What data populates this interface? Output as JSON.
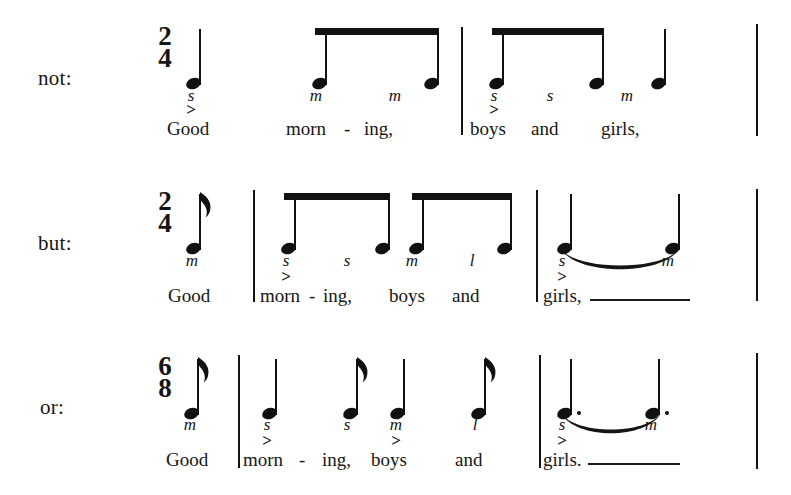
{
  "figure": {
    "background_color": "#ffffff",
    "ink_color": "#141414"
  },
  "systems": [
    {
      "id": "system-not",
      "label": "not:",
      "time_signature": {
        "numerator": "2",
        "denominator": "4"
      },
      "events": [
        {
          "type": "quarter",
          "solfa": "s",
          "accent": ">",
          "lyric": "Good"
        },
        {
          "type": "eighth-beamed",
          "solfa": "m",
          "accent": "",
          "lyric": "morn"
        },
        {
          "type": "hyphen",
          "solfa": "",
          "accent": "",
          "lyric": "-"
        },
        {
          "type": "eighth-beamed",
          "solfa": "m",
          "accent": "",
          "lyric": "ing,"
        },
        {
          "type": "eighth-beamed",
          "solfa": "s",
          "accent": ">",
          "lyric": "boys"
        },
        {
          "type": "eighth-beamed",
          "solfa": "s",
          "accent": "",
          "lyric": "and"
        },
        {
          "type": "quarter",
          "solfa": "m",
          "accent": "",
          "lyric": "girls,"
        }
      ]
    },
    {
      "id": "system-but",
      "label": "but:",
      "time_signature": {
        "numerator": "2",
        "denominator": "4"
      },
      "events": [
        {
          "type": "eighth",
          "solfa": "m",
          "accent": "",
          "lyric": "Good"
        },
        {
          "type": "eighth-beamed",
          "solfa": "s",
          "accent": ">",
          "lyric": "morn"
        },
        {
          "type": "hyphen",
          "solfa": "",
          "accent": "",
          "lyric": "-"
        },
        {
          "type": "eighth-beamed",
          "solfa": "s",
          "accent": "",
          "lyric": "ing,"
        },
        {
          "type": "eighth-beamed",
          "solfa": "m",
          "accent": "",
          "lyric": "boys"
        },
        {
          "type": "eighth-beamed",
          "solfa": "l",
          "accent": "",
          "lyric": "and"
        },
        {
          "type": "quarter-tied",
          "solfa": "s",
          "accent": ">",
          "lyric": "girls,"
        },
        {
          "type": "quarter-tie-end",
          "solfa": "m",
          "accent": "",
          "lyric": ""
        }
      ]
    },
    {
      "id": "system-or",
      "label": "or:",
      "time_signature": {
        "numerator": "6",
        "denominator": "8"
      },
      "events": [
        {
          "type": "eighth",
          "solfa": "m",
          "accent": "",
          "lyric": "Good"
        },
        {
          "type": "quarter",
          "solfa": "s",
          "accent": ">",
          "lyric": "morn"
        },
        {
          "type": "hyphen",
          "solfa": "",
          "accent": "",
          "lyric": "-"
        },
        {
          "type": "eighth",
          "solfa": "s",
          "accent": "",
          "lyric": "ing,"
        },
        {
          "type": "quarter",
          "solfa": "m",
          "accent": ">",
          "lyric": "boys"
        },
        {
          "type": "eighth",
          "solfa": "l",
          "accent": "",
          "lyric": "and"
        },
        {
          "type": "dotted-quarter-tied",
          "solfa": "s",
          "accent": ">",
          "lyric": "girls."
        },
        {
          "type": "dotted-quarter-tie-end",
          "solfa": "m",
          "accent": "",
          "lyric": ""
        }
      ]
    }
  ],
  "labels": {
    "row1": "not:",
    "row2": "but:",
    "row3": "or:"
  },
  "timesigs": {
    "row1_num": "2",
    "row1_den": "4",
    "row2_num": "2",
    "row2_den": "4",
    "row3_num": "6",
    "row3_den": "8"
  },
  "row1": {
    "solfa": {
      "n1": "s",
      "n2": "m",
      "n3": "m",
      "n4": "s",
      "n5": "s",
      "n6": "m"
    },
    "accents": {
      "a1": ">",
      "a2": ">"
    },
    "lyrics": {
      "l1": "Good",
      "l2": "morn",
      "hyphen": "-",
      "l3": "ing,",
      "l4": "boys",
      "l5": "and",
      "l6": "girls,"
    }
  },
  "row2": {
    "solfa": {
      "n0": "m",
      "n1": "s",
      "n2": "s",
      "n3": "m",
      "n4": "l",
      "n5": "s",
      "n6": "m"
    },
    "accents": {
      "a1": ">",
      "a2": ">"
    },
    "lyrics": {
      "l0": "Good",
      "l1": "morn",
      "hyphen": "-",
      "l2": "ing,",
      "l3": "boys",
      "l4": "and",
      "l5": "girls,"
    }
  },
  "row3": {
    "solfa": {
      "n0": "m",
      "n1": "s",
      "n2": "s",
      "n3": "m",
      "n4": "l",
      "n5": "s",
      "n6": "m"
    },
    "accents": {
      "a1": ">",
      "a2": ">",
      "a3": ">"
    },
    "lyrics": {
      "l0": "Good",
      "l1": "morn",
      "hyphen": "-",
      "l2": "ing,",
      "l3": "boys",
      "l4": "and",
      "l5": "girls."
    }
  }
}
